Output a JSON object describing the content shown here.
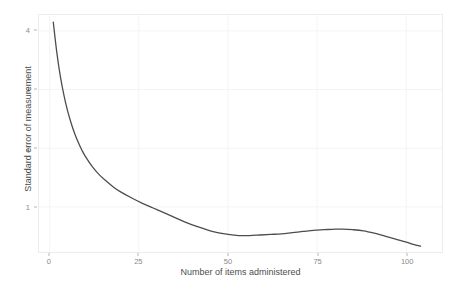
{
  "chart_data": {
    "type": "line",
    "title": "",
    "subtitle": "",
    "xlabel": "Number of items administered",
    "ylabel": "Standard error of measurement",
    "xlim": [
      -3,
      110
    ],
    "ylim": [
      0.23,
      4.27
    ],
    "xticks": [
      0,
      25,
      50,
      75,
      100
    ],
    "xtick_labels": [
      "0",
      "25",
      "50",
      "75",
      "100"
    ],
    "yticks": [
      1,
      2,
      3,
      4
    ],
    "ytick_labels": [
      "1",
      "2",
      "3",
      "4"
    ],
    "grid": true,
    "legend": "none",
    "series": [
      {
        "name": "Standard error of measurement",
        "color": "#4d4d4d",
        "line_width": 1.3,
        "x": [
          1,
          2,
          3,
          4,
          5,
          6,
          7,
          8,
          9,
          10,
          12,
          14,
          16,
          18,
          20,
          23,
          26,
          29,
          32,
          35,
          38,
          41,
          44,
          47,
          50,
          53,
          56,
          59,
          62,
          65,
          68,
          71,
          74,
          77,
          80,
          82,
          85,
          88,
          91,
          94,
          97,
          100,
          102,
          104
        ],
        "y": [
          4.15,
          3.63,
          3.22,
          2.9,
          2.64,
          2.43,
          2.25,
          2.1,
          1.97,
          1.86,
          1.68,
          1.54,
          1.43,
          1.33,
          1.25,
          1.15,
          1.06,
          0.98,
          0.9,
          0.82,
          0.74,
          0.67,
          0.61,
          0.56,
          0.53,
          0.51,
          0.51,
          0.52,
          0.53,
          0.54,
          0.56,
          0.58,
          0.6,
          0.61,
          0.62,
          0.62,
          0.61,
          0.59,
          0.55,
          0.5,
          0.45,
          0.4,
          0.36,
          0.33
        ]
      }
    ]
  },
  "axes": {
    "x_title": "Number of items administered",
    "y_title": "Standard error of measurement"
  }
}
